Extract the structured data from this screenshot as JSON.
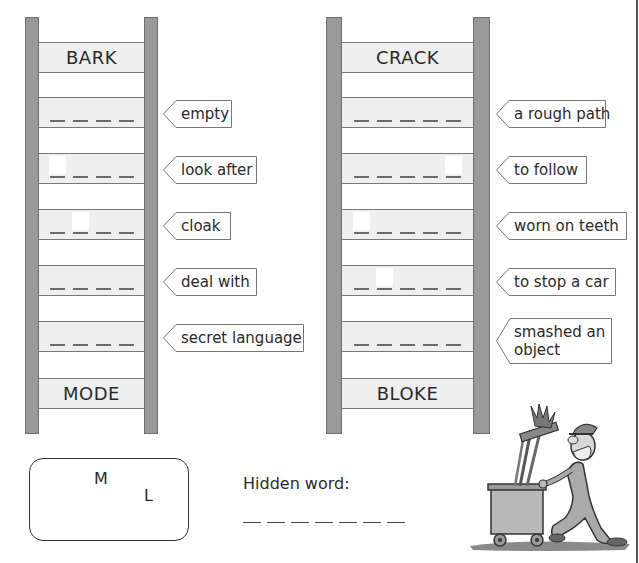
{
  "ladders": [
    {
      "id": "left",
      "top_word": "BARK",
      "bottom_word": "MODE",
      "rows": [
        {
          "clue": "empty",
          "letters": 4,
          "given_positions": []
        },
        {
          "clue": "look after",
          "letters": 4,
          "given_positions": [
            0
          ]
        },
        {
          "clue": "cloak",
          "letters": 4,
          "given_positions": [
            1
          ]
        },
        {
          "clue": "deal with",
          "letters": 4,
          "given_positions": []
        },
        {
          "clue": "secret language",
          "letters": 4,
          "given_positions": []
        }
      ]
    },
    {
      "id": "right",
      "top_word": "CRACK",
      "bottom_word": "BLOKE",
      "rows": [
        {
          "clue": "a rough path",
          "letters": 5,
          "given_positions": []
        },
        {
          "clue": "to follow",
          "letters": 5,
          "given_positions": [
            4
          ]
        },
        {
          "clue": "worn on teeth",
          "letters": 5,
          "given_positions": [
            0
          ]
        },
        {
          "clue": "to stop a car",
          "letters": 5,
          "given_positions": [
            1
          ]
        },
        {
          "clue": "smashed an object",
          "clue_lines": [
            "smashed an",
            "object"
          ],
          "letters": 5,
          "given_positions": []
        }
      ]
    }
  ],
  "letters_box": {
    "letters": [
      "M",
      "L"
    ]
  },
  "hidden_word": {
    "label": "Hidden word:",
    "blank_count": 7
  },
  "illustration": {
    "icon": "man-pushing-cleaning-cart-illustration"
  },
  "colors": {
    "rail": "#9a9a9a",
    "rung": "#efefef",
    "text": "#2a2a2a",
    "border": "#555555"
  }
}
